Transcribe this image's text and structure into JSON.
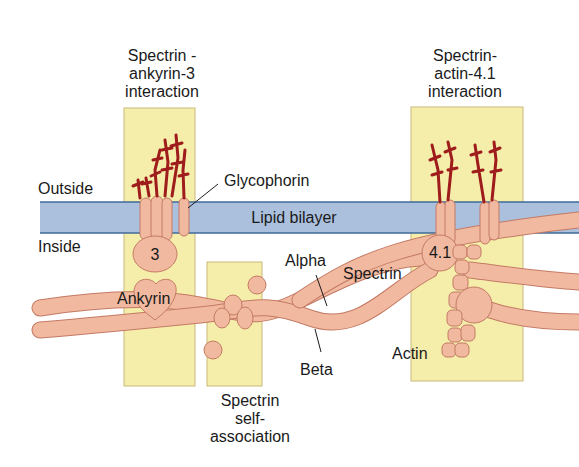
{
  "colors": {
    "panel_fill": "#f5eeaa",
    "panel_stroke": "#c9b97a",
    "bilayer_fill": "#aac0dd",
    "bilayer_stroke": "#3f6a9a",
    "protein_fill": "#f0b9a0",
    "protein_stroke": "#c47a64",
    "glyco_chain": "#9e1c1c",
    "text": "#1a1a1a"
  },
  "labels": {
    "spectrin_ankyrin": [
      "Spectrin -",
      "ankyrin-3",
      "interaction"
    ],
    "spectrin_actin": [
      "Spectrin-",
      "actin-4.1",
      "interaction"
    ],
    "self_association": [
      "Spectrin",
      "self-",
      "association"
    ],
    "outside": "Outside",
    "inside": "Inside",
    "glycophorin": "Glycophorin",
    "lipid_bilayer": "Lipid bilayer",
    "band3": "3",
    "ankyrin": "Ankyrin",
    "alpha": "Alpha",
    "spectrin": "Spectrin",
    "beta": "Beta",
    "band41": "4.1",
    "actin": "Actin"
  }
}
